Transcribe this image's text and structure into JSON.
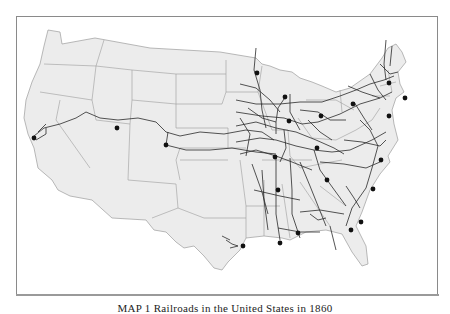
{
  "map": {
    "caption": "MAP 1  Railroads in the United States in 1860",
    "colors": {
      "land": "#ececec",
      "land_east": "#e4e4e4",
      "border": "#9c9c9c",
      "rail": "#2a2a2a",
      "city": "#111111",
      "frame": "#8a8a8a"
    },
    "region_outline": "M48,30 L60,32 L62,44 L95,38 L150,48 L220,52 L256,58 L262,64 L270,66 L280,70 L292,72 L300,78 L312,82 L322,86 L336,92 L350,88 L370,74 L382,58 L388,48 L396,44 L402,52 L406,62 L398,72 L400,84 L404,92 L396,98 L392,110 L394,124 L398,140 L388,156 L390,162 L380,174 L370,190 L362,212 L356,226 L366,246 L368,264 L362,266 L352,252 L342,234 L326,230 L306,232 L290,240 L282,238 L264,236 L246,238 L240,250 L228,262 L222,270 L214,268 L204,256 L194,246 L184,248 L176,242 L166,232 L154,230 L146,220 L112,218 L92,200 L70,196 L58,190 L52,180 L38,168 L34,148 L28,134 L24,118 L26,100 L32,82 L40,64 L44,46 Z",
    "state_borders": [
      "M44,64 L96,66 L92,100",
      "M40,92 L92,100",
      "M60,100 L56,120 L90,168",
      "M92,100 L96,120 L130,124 L132,100",
      "M96,66 L104,40",
      "M96,66 L132,70 L132,100",
      "M132,70 L176,74 L176,108",
      "M132,100 L176,104",
      "M130,124 L128,180 L176,184",
      "M176,74 L226,74",
      "M176,108 L176,128 L228,128",
      "M176,104 L222,104",
      "M226,60 L226,92 L258,92",
      "M222,104 L226,92",
      "M228,128 L228,148 L180,148 L176,160 L180,180",
      "M180,160 L228,160",
      "M228,148 L246,148",
      "M176,184 L178,208 L152,218",
      "M178,208 L204,218 L246,218",
      "M240,160 L246,206 L246,238",
      "M246,206 L280,206",
      "M258,92 L262,66",
      "M258,92 L272,130",
      "M272,130 L288,130 L290,156",
      "M290,156 L300,168 L320,164 L342,160",
      "M262,160 L312,160",
      "M264,180 L264,236",
      "M282,184 L290,238",
      "M300,182 L330,226",
      "M320,186 L346,206",
      "M298,118 L312,138 L336,140",
      "M336,140 L356,130 L372,120 L380,108",
      "M306,100 L336,100 L354,110",
      "M340,90 L342,112",
      "M372,96 L390,96",
      "M380,86 L396,82",
      "M388,70 L392,92"
    ],
    "rail_lines": [
      "M34,136 L44,128 L60,124 L76,118 L86,112 L100,118 L118,120 L138,118 L156,122 L166,132 L180,136 L200,132 L224,134 L246,130 L262,132 L274,140",
      "M36,140 L46,134 L46,128",
      "M38,132 L46,124",
      "M166,145 L168,132",
      "M166,145 L186,150 L210,150 L232,148 L256,152 L276,154",
      "M256,48 L254,70 L260,90 L262,110 L266,128",
      "M240,84 L256,88 L270,100 L280,112",
      "M286,96 L278,108 L276,122 L276,134",
      "M290,94 L290,112 L300,130",
      "M236,100 L256,104 L280,104 L300,102 L322,102 L340,96 L356,90 L370,84 L384,80 L394,76",
      "M236,112 L262,116 L284,118 L302,124 L318,122 L340,114 L360,104 L380,98 L392,92",
      "M236,126 L256,122 L276,128 L296,132 L316,140 L334,148 L344,154",
      "M236,142 L260,138 L276,140 L296,146 L314,150 L332,152",
      "M240,154 L256,150 L276,156 L292,162 L312,170",
      "M276,156 L276,190 L276,214 L280,240",
      "M290,158 L292,190 L292,214 L300,238",
      "M262,170 L264,200 L268,230",
      "M252,164 L262,192 L268,214",
      "M300,162 L310,186 L318,206 L326,226",
      "M314,150 L320,170 L330,184 L346,206",
      "M320,162 L344,164 L366,168 L380,162",
      "M332,152 L350,150 L372,140 L386,132",
      "M344,140 L362,142 L380,146 L386,140",
      "M360,120 L370,130 L378,146 L372,168 L366,188",
      "M366,188 L352,208 L346,226",
      "M346,186 L354,198 L360,208",
      "M300,212 L320,210 L344,214",
      "M278,228 L300,232 L320,232",
      "M330,226 L336,250",
      "M386,40 L384,64 L386,80",
      "M392,46 L390,66",
      "M380,64 L390,74 L398,72",
      "M370,74 L378,90 L386,100",
      "M348,86 L362,92 L380,98",
      "M354,102 L364,118 L372,130",
      "M300,110 L318,112 L330,120 L346,120",
      "M308,120 L320,132 L332,140",
      "M248,108 L262,118 L276,122",
      "M240,118 L250,134 L246,156",
      "M284,130 L286,148 L280,162",
      "M226,240 L232,244 L238,246",
      "M222,236 L230,240",
      "M230,248 L238,246",
      "M310,214 L318,220 L326,218",
      "M254,190 L280,196 L300,200"
    ],
    "cities": [
      {
        "x": 34,
        "y": 138
      },
      {
        "x": 117,
        "y": 128
      },
      {
        "x": 166,
        "y": 145
      },
      {
        "x": 257,
        "y": 73
      },
      {
        "x": 285,
        "y": 97
      },
      {
        "x": 289,
        "y": 121
      },
      {
        "x": 321,
        "y": 116
      },
      {
        "x": 353,
        "y": 104
      },
      {
        "x": 389,
        "y": 83
      },
      {
        "x": 405,
        "y": 98
      },
      {
        "x": 389,
        "y": 116
      },
      {
        "x": 317,
        "y": 148
      },
      {
        "x": 275,
        "y": 157
      },
      {
        "x": 381,
        "y": 160
      },
      {
        "x": 327,
        "y": 180
      },
      {
        "x": 278,
        "y": 190
      },
      {
        "x": 373,
        "y": 189
      },
      {
        "x": 361,
        "y": 222
      },
      {
        "x": 351,
        "y": 230
      },
      {
        "x": 298,
        "y": 233
      },
      {
        "x": 280,
        "y": 243
      },
      {
        "x": 243,
        "y": 246
      }
    ]
  }
}
